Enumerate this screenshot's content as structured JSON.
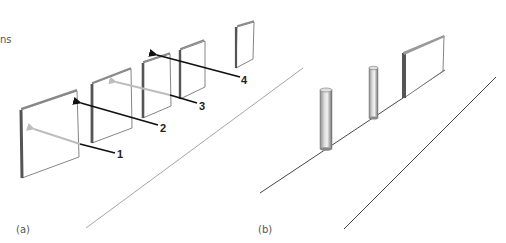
{
  "figure": {
    "partial_text_top_left": "ns",
    "panels": [
      {
        "id": "a",
        "label": "(a)",
        "arrow_labels": [
          "1",
          "2",
          "3",
          "4"
        ],
        "description": "Sequence of standing square panels along a ground line with numbered arrows"
      },
      {
        "id": "b",
        "label": "(b)",
        "description": "Two cylindrical posts and a rectangular board standing on a line, with a parallel ground line"
      }
    ],
    "colors": {
      "panel_edge": "#555555",
      "panel_face": "#ffffff",
      "ground_line": "#888888",
      "arrow_gray": "#bdbdbd",
      "arrow_black": "#111111",
      "cylinder_dark": "#7a7a7a",
      "cylinder_light": "#e6e6e6"
    }
  }
}
